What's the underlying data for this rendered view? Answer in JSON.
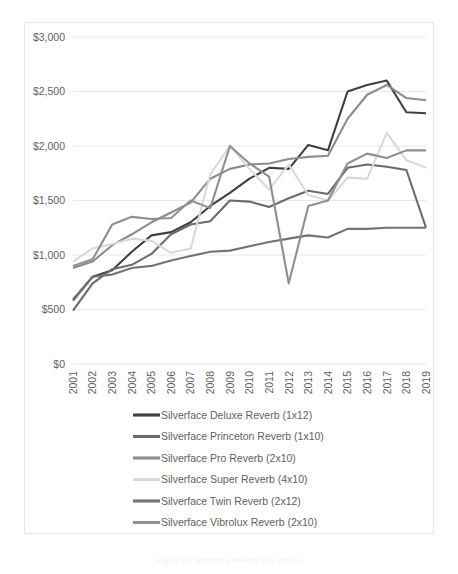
{
  "chart_data": {
    "type": "line",
    "title": "",
    "xlabel": "",
    "ylabel": "",
    "x": [
      2001,
      2002,
      2003,
      2004,
      2005,
      2006,
      2007,
      2008,
      2009,
      2010,
      2011,
      2012,
      2013,
      2014,
      2015,
      2016,
      2017,
      2018,
      2019
    ],
    "categories": [
      "2001",
      "2002",
      "2003",
      "2004",
      "2005",
      "2006",
      "2007",
      "2008",
      "2009",
      "2010",
      "2011",
      "2012",
      "2013",
      "2014",
      "2015",
      "2016",
      "2017",
      "2018",
      "2019"
    ],
    "ylim": [
      0,
      3000
    ],
    "ytick_values": [
      0,
      500,
      1000,
      1500,
      2000,
      2500,
      3000
    ],
    "ytick_labels": [
      "$0",
      "$500",
      "$1,000",
      "$1,500",
      "$2,000",
      "$2,500",
      "$3,000"
    ],
    "grid": true,
    "legend_position": "bottom",
    "series": [
      {
        "name": "Silverface Deluxe Reverb (1x12)",
        "color": "#404040",
        "values": [
          590,
          800,
          860,
          1030,
          1180,
          1210,
          1300,
          1450,
          1570,
          1700,
          1800,
          1790,
          2010,
          1960,
          2500,
          2560,
          2600,
          2310,
          2300
        ]
      },
      {
        "name": "Silverface Princeton Reverb (1x10)",
        "color": "#6b6b6b",
        "values": [
          490,
          740,
          870,
          910,
          1010,
          1190,
          1280,
          1310,
          1500,
          1490,
          1440,
          1520,
          1590,
          1560,
          1800,
          1830,
          1810,
          1780,
          1250
        ]
      },
      {
        "name": "Silverface Pro Reverb (2x10)",
        "color": "#8c8c8c",
        "values": [
          880,
          940,
          1090,
          1190,
          1300,
          1390,
          1480,
          1700,
          1790,
          1830,
          1840,
          1880,
          1900,
          1910,
          2250,
          2470,
          2560,
          2440,
          2420
        ]
      },
      {
        "name": "Silverface Super Reverb (4x10)",
        "color": "#d9d9d9",
        "values": [
          940,
          1060,
          1100,
          1150,
          1130,
          1020,
          1060,
          1740,
          2000,
          1790,
          1600,
          1830,
          1550,
          1500,
          1710,
          1700,
          2120,
          1870,
          1800
        ]
      },
      {
        "name": "Silverface Twin Reverb (2x12)",
        "color": "#737373",
        "values": [
          580,
          800,
          820,
          880,
          900,
          950,
          990,
          1030,
          1040,
          1080,
          1120,
          1150,
          1180,
          1160,
          1240,
          1240,
          1250,
          1250,
          1250
        ]
      },
      {
        "name": "Silverface Vibrolux Reverb (2x10)",
        "color": "#8f8f8f",
        "values": [
          900,
          960,
          1280,
          1350,
          1330,
          1340,
          1500,
          1430,
          2000,
          1840,
          1720,
          740,
          1450,
          1500,
          1840,
          1930,
          1890,
          1960,
          1960
        ]
      }
    ]
  },
  "caption": {
    "text": "Figure 15. Silverface Reverb amp values"
  }
}
